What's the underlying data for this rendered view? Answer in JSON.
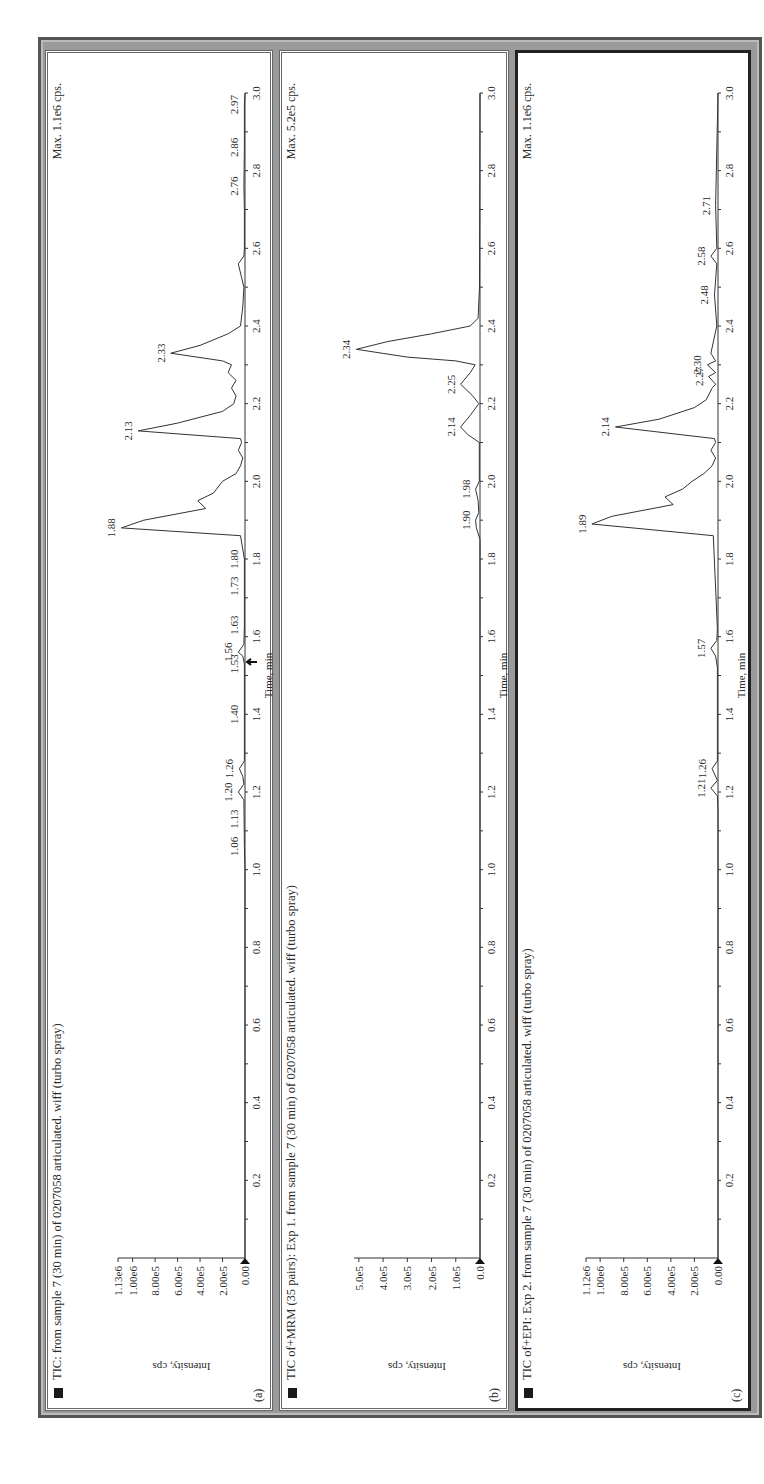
{
  "figure": {
    "panels": [
      {
        "id": "a",
        "panel_label": "(a)",
        "title": "TIC: from sample 7 (30 min) of  0207058 articulated. wiff (turbo spray)",
        "max_label": "Max. 1.1e6 cps.",
        "ylabel": "Intensity, cps",
        "xlabel": "Time, min",
        "y_ticks": [
          "0.00",
          "2.00e5",
          "4.00e5",
          "6.00e5",
          "8.00e5",
          "1.00e6",
          "1.13e6"
        ],
        "peak_labels": [
          "1.06",
          "1.13",
          "1.20",
          "1.26",
          "1.40",
          "1.53",
          "1.56",
          "1.63",
          "1.73",
          "1.80",
          "1.88",
          "2.13",
          "2.33",
          "2.76",
          "2.86",
          "2.97"
        ]
      },
      {
        "id": "b",
        "panel_label": "(b)",
        "title": "TIC of+MRM (35 pairs): Exp 1. from sample 7 (30 min) of 0207058 articulated. wiff (turbo spray)",
        "max_label": "Max. 5.2e5 cps.",
        "ylabel": "Intensity, cps",
        "xlabel": "Time, min",
        "y_ticks": [
          "0.0",
          "1.0e5",
          "2.0e5",
          "3.0e5",
          "4.0e5",
          "5.0e5"
        ],
        "peak_labels": [
          "1.90",
          "1.98",
          "2.14",
          "2.25",
          "2.34"
        ]
      },
      {
        "id": "c",
        "panel_label": "(c)",
        "title": "TIC of+EPI: Exp 2. from sample 7 (30 min) of 0207058 articulated. wiff (turbo spray)",
        "max_label": "Max. 1.1e6 cps.",
        "ylabel": "Intensity, cps",
        "xlabel": "Time, min",
        "y_ticks": [
          "0.00",
          "2.00e5",
          "4.00e5",
          "6.00e5",
          "8.00e5",
          "1.00e6",
          "1.12e6"
        ],
        "peak_labels": [
          "1.21",
          "1.26",
          "1.57",
          "1.89",
          "2.14",
          "2.27",
          "2.30",
          "2.48",
          "2.58",
          "2.71"
        ]
      }
    ],
    "x_ticks": [
      "0.2",
      "0.4",
      "0.6",
      "0.8",
      "1.0",
      "1.2",
      "1.4",
      "1.6",
      "1.8",
      "2.0",
      "2.2",
      "2.4",
      "2.6",
      "2.8",
      "3.0"
    ]
  },
  "chart_data": [
    {
      "type": "line",
      "title": "TIC: from sample 7 (30 min) of 0207058 articulated. wiff (turbo spray)",
      "panel": "(a)",
      "xlabel": "Time, min",
      "ylabel": "Intensity, cps",
      "xlim": [
        0,
        3.0
      ],
      "ylim": [
        0,
        1130000
      ],
      "max_annotation": "Max. 1.1e6 cps.",
      "x": [
        0.0,
        1.0,
        1.06,
        1.13,
        1.18,
        1.2,
        1.22,
        1.24,
        1.26,
        1.28,
        1.4,
        1.53,
        1.55,
        1.56,
        1.58,
        1.63,
        1.73,
        1.8,
        1.86,
        1.88,
        1.9,
        1.93,
        1.95,
        1.97,
        2.0,
        2.02,
        2.04,
        2.06,
        2.08,
        2.1,
        2.11,
        2.13,
        2.15,
        2.18,
        2.2,
        2.22,
        2.24,
        2.26,
        2.28,
        2.3,
        2.31,
        2.33,
        2.35,
        2.38,
        2.4,
        2.45,
        2.5,
        2.56,
        2.58,
        2.6,
        2.7,
        2.76,
        2.86,
        2.97,
        3.0
      ],
      "y": [
        0,
        0,
        5000,
        8000,
        10000,
        60000,
        10000,
        20000,
        50000,
        5000,
        5000,
        5000,
        20000,
        60000,
        10000,
        5000,
        5000,
        5000,
        40000,
        1100000,
        900000,
        350000,
        420000,
        280000,
        200000,
        80000,
        40000,
        20000,
        60000,
        30000,
        40000,
        950000,
        600000,
        200000,
        100000,
        80000,
        120000,
        80000,
        150000,
        120000,
        200000,
        660000,
        400000,
        150000,
        40000,
        20000,
        10000,
        60000,
        10000,
        5000,
        5000,
        10000,
        5000,
        5000,
        0
      ],
      "peak_labels": [
        1.06,
        1.13,
        1.2,
        1.26,
        1.4,
        1.53,
        1.56,
        1.63,
        1.73,
        1.8,
        1.88,
        2.13,
        2.33,
        2.76,
        2.86,
        2.97
      ]
    },
    {
      "type": "line",
      "title": "TIC of+MRM (35 pairs): Exp 1. from sample 7 (30 min) of 0207058 articulated. wiff (turbo spray)",
      "panel": "(b)",
      "xlabel": "Time, min",
      "ylabel": "Intensity, cps",
      "xlim": [
        0,
        3.0
      ],
      "ylim": [
        0,
        520000
      ],
      "max_annotation": "Max. 5.2e5 cps.",
      "x": [
        0.0,
        1.85,
        1.88,
        1.9,
        1.92,
        1.95,
        1.98,
        2.0,
        2.1,
        2.12,
        2.14,
        2.17,
        2.2,
        2.22,
        2.25,
        2.28,
        2.3,
        2.31,
        2.32,
        2.34,
        2.36,
        2.38,
        2.4,
        2.42,
        2.5,
        3.0
      ],
      "y": [
        0,
        0,
        15000,
        18000,
        5000,
        8000,
        18000,
        3000,
        3000,
        50000,
        80000,
        40000,
        5000,
        30000,
        80000,
        40000,
        20000,
        100000,
        300000,
        510000,
        380000,
        200000,
        40000,
        8000,
        2000,
        0
      ],
      "peak_labels": [
        1.9,
        1.98,
        2.14,
        2.25,
        2.34
      ]
    },
    {
      "type": "line",
      "title": "TIC of+EPI: Exp 2. from sample 7 (30 min) of 0207058 articulated. wiff (turbo spray)",
      "panel": "(c)",
      "xlabel": "Time, min",
      "ylabel": "Intensity, cps",
      "xlim": [
        0,
        3.0
      ],
      "ylim": [
        0,
        1120000
      ],
      "max_annotation": "Max. 1.1e6 cps.",
      "x": [
        0.0,
        1.15,
        1.19,
        1.21,
        1.23,
        1.26,
        1.28,
        1.52,
        1.55,
        1.57,
        1.59,
        1.62,
        1.86,
        1.89,
        1.91,
        1.94,
        1.96,
        1.98,
        2.0,
        2.02,
        2.04,
        2.06,
        2.08,
        2.1,
        2.11,
        2.14,
        2.16,
        2.19,
        2.21,
        2.24,
        2.25,
        2.27,
        2.28,
        2.3,
        2.31,
        2.33,
        2.4,
        2.48,
        2.56,
        2.58,
        2.6,
        2.71,
        3.0
      ],
      "y": [
        0,
        0,
        5000,
        60000,
        5000,
        50000,
        5000,
        5000,
        20000,
        60000,
        10000,
        5000,
        40000,
        1070000,
        900000,
        380000,
        450000,
        300000,
        220000,
        120000,
        50000,
        20000,
        60000,
        20000,
        30000,
        870000,
        500000,
        200000,
        100000,
        50000,
        20000,
        80000,
        20000,
        90000,
        20000,
        60000,
        10000,
        30000,
        10000,
        60000,
        10000,
        20000,
        0
      ],
      "peak_labels": [
        1.21,
        1.26,
        1.57,
        1.89,
        2.14,
        2.27,
        2.3,
        2.48,
        2.58,
        2.71
      ]
    }
  ]
}
